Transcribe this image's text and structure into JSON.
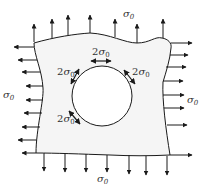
{
  "diagram": {
    "colors": {
      "stroke": "#1a1a1a",
      "plate_fill": "#f2f2f2",
      "hole_fill": "#ffffff",
      "text": "#333333"
    },
    "labels": {
      "top_load": {
        "base": "σ",
        "sub": "0"
      },
      "left_load": {
        "base": "σ",
        "sub": "0"
      },
      "right_load": {
        "base": "σ",
        "sub": "0"
      },
      "bottom_load": {
        "base": "σ",
        "sub": "0"
      },
      "hole_top": {
        "coef": "2",
        "base": "σ",
        "sub": "0"
      },
      "hole_upper_left": {
        "coef": "2",
        "base": "σ",
        "sub": "0"
      },
      "hole_upper_right": {
        "coef": "2",
        "base": "σ",
        "sub": "0"
      },
      "hole_lower_left": {
        "coef": "2",
        "base": "σ",
        "sub": "0"
      }
    },
    "arrow_counts": {
      "top": 7,
      "bottom": 7,
      "left": 9,
      "right": 8
    }
  }
}
